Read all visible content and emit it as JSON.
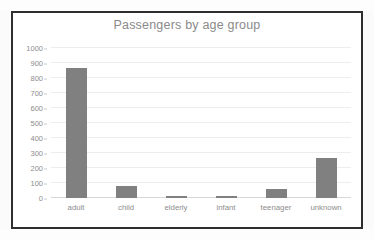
{
  "chart_data": {
    "type": "bar",
    "title": "Passengers by age group",
    "xlabel": "",
    "ylabel": "",
    "categories": [
      "adult",
      "child",
      "elderly",
      "infant",
      "teenager",
      "unknown"
    ],
    "values": [
      870,
      79,
      12,
      12,
      62,
      264
    ],
    "ylim": [
      0,
      1000
    ],
    "yticks": [
      0,
      100,
      200,
      300,
      400,
      500,
      600,
      700,
      800,
      900,
      1000
    ],
    "ytick_labels": [
      "0",
      "100",
      "200",
      "300",
      "400",
      "500",
      "600",
      "700",
      "800",
      "900",
      "1000"
    ],
    "grid": true,
    "legend": false,
    "legend_position": "none",
    "series": [
      {
        "name": "Passengers",
        "values": [
          870,
          79,
          12,
          12,
          62,
          264
        ]
      }
    ],
    "colors": {
      "bar": "#808080",
      "gridline": "#ededed",
      "axis": "#d8d8d8",
      "title_text": "#8a8a8a",
      "tick_text": "#8d8d8d",
      "frame": "#2e2e2e",
      "plot_background": "#ffffff"
    }
  }
}
